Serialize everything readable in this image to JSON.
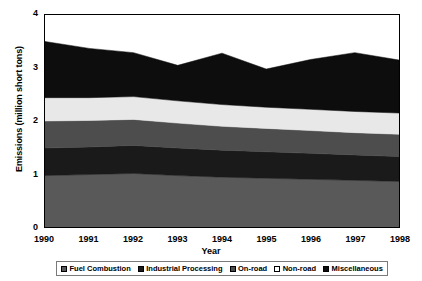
{
  "chart_data": {
    "type": "area",
    "title": "",
    "xlabel": "Year",
    "ylabel": "Emissions (million short tons)",
    "x": [
      1990,
      1991,
      1992,
      1993,
      1994,
      1995,
      1996,
      1997,
      1998
    ],
    "categories": [
      "1990",
      "1991",
      "1992",
      "1993",
      "1994",
      "1995",
      "1996",
      "1997",
      "1998"
    ],
    "xlim": [
      1990,
      1998
    ],
    "ylim": [
      0,
      4
    ],
    "yticks": [
      "0",
      "1",
      "2",
      "3",
      "4"
    ],
    "ytick_values": [
      0,
      1,
      2,
      3,
      4
    ],
    "grid": false,
    "stacked": true,
    "legend_position": "bottom",
    "series": [
      {
        "name": "Fuel Combustion",
        "color": "#595959",
        "values": [
          0.97,
          0.99,
          1.01,
          0.97,
          0.94,
          0.92,
          0.9,
          0.88,
          0.86
        ]
      },
      {
        "name": "Industrial Processing",
        "color": "#1a1a1a",
        "values": [
          0.52,
          0.52,
          0.53,
          0.52,
          0.51,
          0.5,
          0.49,
          0.48,
          0.47
        ]
      },
      {
        "name": "On-road",
        "color": "#4d4d4d",
        "values": [
          0.51,
          0.5,
          0.49,
          0.47,
          0.45,
          0.44,
          0.43,
          0.42,
          0.42
        ]
      },
      {
        "name": "Non-road",
        "color": "#e8e8e8",
        "values": [
          0.44,
          0.43,
          0.43,
          0.42,
          0.41,
          0.4,
          0.4,
          0.4,
          0.4
        ]
      },
      {
        "name": "Miscellaneous",
        "color": "#0d0d0d",
        "values": [
          1.06,
          0.93,
          0.83,
          0.67,
          0.97,
          0.72,
          0.94,
          1.11,
          1.0
        ]
      }
    ],
    "totals": [
      3.5,
      3.37,
      3.29,
      3.05,
      3.28,
      2.98,
      3.16,
      3.29,
      3.15
    ]
  },
  "axes": {
    "y_title": "Emissions (million short tons)",
    "x_title": "Year"
  },
  "legend": {
    "items": [
      {
        "label": "Fuel Combustion",
        "color": "#595959"
      },
      {
        "label": "Industrial Processing",
        "color": "#1a1a1a"
      },
      {
        "label": "On-road",
        "color": "#4d4d4d"
      },
      {
        "label": "Non-road",
        "color": "#ffffff"
      },
      {
        "label": "Miscellaneous",
        "color": "#0d0d0d"
      }
    ]
  }
}
